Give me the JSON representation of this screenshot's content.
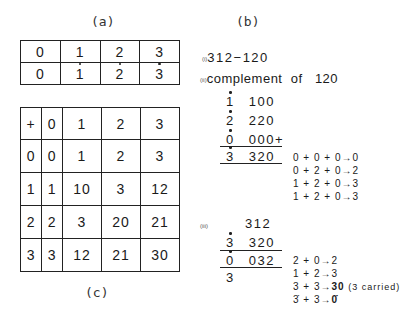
{
  "captions": {
    "a": "(a)",
    "b": "(b)",
    "c": "(c)"
  },
  "table_a": {
    "rows": [
      [
        {
          "v": "0",
          "dot": false
        },
        {
          "v": "1",
          "dot": false
        },
        {
          "v": "2",
          "dot": false
        },
        {
          "v": "3",
          "dot": false
        }
      ],
      [
        {
          "v": "0",
          "dot": false
        },
        {
          "v": "1",
          "dot": true
        },
        {
          "v": "2",
          "dot": true
        },
        {
          "v": "3",
          "dot": true
        }
      ]
    ]
  },
  "table_c": {
    "header": [
      "+",
      "0",
      "1",
      "2",
      "3"
    ],
    "rows": [
      [
        "0",
        "0",
        "1",
        "2",
        "3"
      ],
      [
        "1",
        "1",
        "10",
        "3",
        "12"
      ],
      [
        "2",
        "2",
        "3",
        "20",
        "21"
      ],
      [
        "3",
        "3",
        "12",
        "21",
        "30"
      ]
    ]
  },
  "part_b": {
    "i": {
      "label": "(i)",
      "text": "312−120"
    },
    "ii": {
      "label": "(ii)",
      "title": "complement  of   120",
      "lines": [
        {
          "lead": "1",
          "lead_dot": true,
          "digits": "100",
          "suffix": ""
        },
        {
          "lead": "2",
          "lead_dot": true,
          "digits": "220",
          "suffix": ""
        },
        {
          "lead": "0",
          "lead_dot": true,
          "digits": "000",
          "suffix": "+"
        },
        {
          "lead": "3",
          "lead_dot": true,
          "digits": "320",
          "suffix": ""
        }
      ],
      "steps": [
        "0 + 0 + 0→0",
        "0 + 2 + 0→2",
        "1 + 2 + 0→3",
        "1 + 2 + 0→3"
      ]
    },
    "iii": {
      "label": "(iii)",
      "lines": [
        {
          "lead": "",
          "lead_dot": false,
          "digits": "312"
        },
        {
          "lead": "3",
          "lead_dot": true,
          "digits": "320"
        },
        {
          "lead": "0",
          "lead_dot": true,
          "digits": "032"
        },
        {
          "lead": "3",
          "lead_dot": false,
          "digits": ""
        }
      ],
      "steps": [
        {
          "text": "2 + 0→2",
          "bold": "",
          "note": ""
        },
        {
          "text": "1 + 2→3",
          "bold": "",
          "note": ""
        },
        {
          "text": "3 + 3→",
          "bold": "30",
          "note": " (3 carried)"
        },
        {
          "text": "3̇ + 3→",
          "bold": "0̇",
          "note": ""
        }
      ]
    }
  }
}
